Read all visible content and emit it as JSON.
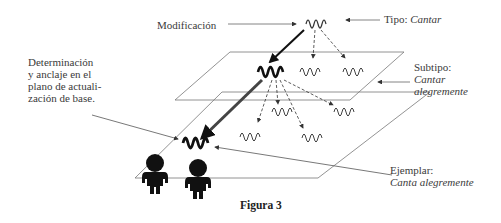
{
  "figure": {
    "caption": "Figura 3",
    "labels": {
      "modificacion": "Modificación",
      "tipo_prefix": "Tipo: ",
      "tipo_value": "Cantar",
      "subtipo_prefix": "Subtipo:",
      "subtipo_value_line1": "Cantar",
      "subtipo_value_line2": "alegremente",
      "determinacion_line1": "Determinación",
      "determinacion_line2": "y anclaje en el",
      "determinacion_line3": "plano de actuali-",
      "determinacion_line4": "zación de base.",
      "ejemplar_prefix": "Ejemplar:",
      "ejemplar_value": "Canta alegremente"
    },
    "levels": [
      {
        "name": "Tipo",
        "value": "Cantar",
        "glyphs": 1
      },
      {
        "name": "Subtipo",
        "value": "Cantar alegremente",
        "glyphs": 3
      },
      {
        "name": "Ejemplar",
        "value": "Canta alegremente",
        "glyphs": 5
      }
    ],
    "colors": {
      "line": "#555555",
      "bold": "#111111",
      "figure": "#111111"
    }
  }
}
